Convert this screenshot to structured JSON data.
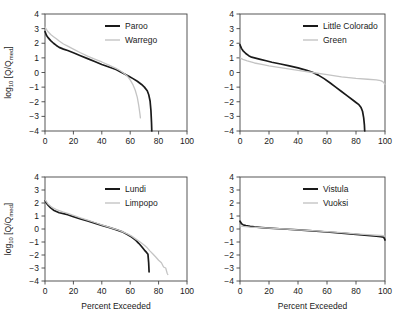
{
  "figure": {
    "axis": {
      "xlabel": "Percent Exceeded",
      "ylabel_main": "log",
      "ylabel_sub": "10",
      "ylabel_rest": " [Q/Q",
      "ylabel_sub2": "med",
      "ylabel_end": "]",
      "xticks": [
        "0",
        "20",
        "40",
        "60",
        "80",
        "100"
      ],
      "yticks": [
        "4",
        "3",
        "2",
        "1",
        "0",
        "−1",
        "−2",
        "−3",
        "−4"
      ],
      "xlim": [
        0,
        100
      ],
      "ylim": [
        -4,
        4
      ]
    },
    "colors": {
      "dark": "#1a1a1a",
      "light": "#c4c4c4",
      "axis": "#444444"
    }
  },
  "chart_data": [
    {
      "type": "line",
      "panel": "top-left",
      "title": "",
      "xlabel": "",
      "ylabel": "log10 [Q/Qmed]",
      "xlim": [
        0,
        100
      ],
      "ylim": [
        -4,
        4
      ],
      "grid": false,
      "legend_position": "top-right",
      "series": [
        {
          "name": "Paroo",
          "color": "#1a1a1a",
          "x": [
            0,
            1,
            2,
            4,
            6,
            8,
            10,
            13,
            16,
            20,
            25,
            30,
            35,
            40,
            45,
            50,
            53,
            56,
            59,
            62,
            65,
            68,
            70,
            72,
            73,
            74,
            74.6,
            75,
            75.2
          ],
          "y": [
            2.8,
            2.55,
            2.4,
            2.18,
            2.0,
            1.85,
            1.72,
            1.6,
            1.5,
            1.35,
            1.15,
            0.95,
            0.75,
            0.55,
            0.38,
            0.2,
            0.05,
            -0.1,
            -0.25,
            -0.42,
            -0.6,
            -0.82,
            -1.0,
            -1.25,
            -1.5,
            -1.95,
            -2.6,
            -3.4,
            -4.0
          ]
        },
        {
          "name": "Warrego",
          "color": "#c4c4c4",
          "x": [
            0,
            1,
            2,
            4,
            6,
            8,
            10,
            13,
            16,
            20,
            25,
            30,
            35,
            40,
            45,
            50,
            53,
            56,
            58,
            60,
            62,
            63.5,
            65,
            66,
            66.8,
            67.2
          ],
          "y": [
            3.1,
            2.95,
            2.8,
            2.6,
            2.45,
            2.3,
            2.15,
            1.95,
            1.8,
            1.6,
            1.35,
            1.12,
            0.92,
            0.72,
            0.5,
            0.28,
            0.12,
            -0.08,
            -0.25,
            -0.5,
            -0.85,
            -1.2,
            -1.7,
            -2.25,
            -2.8,
            -3.1
          ]
        }
      ]
    },
    {
      "type": "line",
      "panel": "top-right",
      "title": "",
      "xlabel": "",
      "ylabel": "",
      "xlim": [
        0,
        100
      ],
      "ylim": [
        -4,
        4
      ],
      "grid": false,
      "legend_position": "top-right",
      "series": [
        {
          "name": "Little Colorado",
          "color": "#1a1a1a",
          "x": [
            0,
            1,
            2,
            4,
            6,
            8,
            10,
            14,
            18,
            22,
            28,
            34,
            40,
            46,
            50,
            54,
            58,
            62,
            66,
            70,
            74,
            78,
            80,
            82,
            83.5,
            84.5,
            85.3,
            85.8,
            86
          ],
          "y": [
            1.9,
            1.65,
            1.5,
            1.3,
            1.15,
            1.05,
            1.0,
            0.9,
            0.8,
            0.7,
            0.58,
            0.45,
            0.32,
            0.15,
            0.02,
            -0.18,
            -0.42,
            -0.7,
            -1.0,
            -1.3,
            -1.6,
            -1.9,
            -2.05,
            -2.2,
            -2.4,
            -2.65,
            -3.1,
            -3.6,
            -4.1
          ]
        },
        {
          "name": "Green",
          "color": "#c4c4c4",
          "x": [
            0,
            2,
            5,
            10,
            15,
            20,
            30,
            40,
            50,
            60,
            70,
            80,
            88,
            94,
            97,
            98.5,
            99.5,
            100
          ],
          "y": [
            1.0,
            0.9,
            0.8,
            0.65,
            0.55,
            0.45,
            0.3,
            0.15,
            0.0,
            -0.15,
            -0.3,
            -0.4,
            -0.46,
            -0.5,
            -0.55,
            -0.62,
            -0.75,
            -0.82
          ]
        }
      ]
    },
    {
      "type": "line",
      "panel": "bottom-left",
      "title": "",
      "xlabel": "Percent Exceeded",
      "ylabel": "log10 [Q/Qmed]",
      "xlim": [
        0,
        100
      ],
      "ylim": [
        -4,
        4
      ],
      "grid": false,
      "legend_position": "top-right",
      "series": [
        {
          "name": "Lundi",
          "color": "#1a1a1a",
          "x": [
            0,
            1,
            2,
            4,
            6,
            8,
            10,
            13,
            16,
            20,
            25,
            30,
            35,
            40,
            45,
            50,
            54,
            58,
            61,
            64,
            66,
            68,
            70,
            71.5,
            72.5,
            73,
            73.3
          ],
          "y": [
            2.2,
            2.0,
            1.85,
            1.62,
            1.45,
            1.35,
            1.25,
            1.18,
            1.1,
            0.95,
            0.78,
            0.62,
            0.45,
            0.28,
            0.12,
            -0.05,
            -0.2,
            -0.42,
            -0.62,
            -0.88,
            -1.1,
            -1.35,
            -1.62,
            -1.8,
            -1.95,
            -2.6,
            -3.3
          ]
        },
        {
          "name": "Limpopo",
          "color": "#c4c4c4",
          "x": [
            0,
            1,
            2,
            4,
            6,
            8,
            10,
            13,
            16,
            20,
            25,
            30,
            35,
            40,
            45,
            50,
            54,
            58,
            61,
            64,
            67,
            70,
            72,
            74,
            76,
            78,
            80,
            82,
            83.5,
            85,
            86,
            86.5
          ],
          "y": [
            2.25,
            2.1,
            1.95,
            1.75,
            1.6,
            1.5,
            1.42,
            1.3,
            1.2,
            1.05,
            0.85,
            0.68,
            0.5,
            0.32,
            0.15,
            -0.02,
            -0.18,
            -0.38,
            -0.55,
            -0.78,
            -1.0,
            -1.25,
            -1.45,
            -1.7,
            -1.92,
            -2.15,
            -2.4,
            -2.6,
            -2.92,
            -3.0,
            -3.4,
            -3.5
          ]
        }
      ]
    },
    {
      "type": "line",
      "panel": "bottom-right",
      "title": "",
      "xlabel": "Percent Exceeded",
      "ylabel": "",
      "xlim": [
        0,
        100
      ],
      "ylim": [
        -4,
        4
      ],
      "grid": false,
      "legend_position": "top-right",
      "series": [
        {
          "name": "Vistula",
          "color": "#1a1a1a",
          "x": [
            0,
            1,
            2,
            4,
            7,
            10,
            15,
            20,
            30,
            40,
            50,
            60,
            70,
            80,
            88,
            94,
            97,
            99,
            99.8,
            100
          ],
          "y": [
            0.6,
            0.42,
            0.33,
            0.26,
            0.2,
            0.16,
            0.11,
            0.07,
            0.0,
            -0.07,
            -0.15,
            -0.23,
            -0.32,
            -0.42,
            -0.5,
            -0.55,
            -0.58,
            -0.62,
            -0.78,
            -0.85
          ]
        },
        {
          "name": "Vuoksi",
          "color": "#c4c4c4",
          "x": [
            0,
            1,
            2,
            4,
            7,
            10,
            15,
            20,
            30,
            40,
            50,
            60,
            70,
            80,
            88,
            94,
            97,
            99,
            100
          ],
          "y": [
            0.25,
            0.22,
            0.2,
            0.18,
            0.15,
            0.13,
            0.1,
            0.07,
            0.01,
            -0.06,
            -0.13,
            -0.2,
            -0.28,
            -0.37,
            -0.44,
            -0.48,
            -0.5,
            -0.52,
            -0.55
          ]
        }
      ]
    }
  ]
}
